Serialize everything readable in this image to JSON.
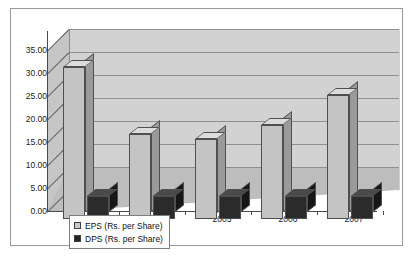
{
  "chart_data": {
    "type": "bar",
    "title": "",
    "xlabel": "",
    "ylabel": "",
    "categories": [
      "2003",
      "2004",
      "2005",
      "2006",
      "2007"
    ],
    "series": [
      {
        "name": "EPS (Rs. per Share)",
        "values": [
          33.0,
          18.5,
          17.5,
          20.5,
          27.0
        ],
        "color": "#c4c4c4"
      },
      {
        "name": "DPS (Rs. per Share)",
        "values": [
          5.0,
          5.0,
          5.0,
          5.0,
          5.0
        ],
        "color": "#2b2b2b"
      }
    ],
    "ylim": [
      0,
      35
    ],
    "ytick_step": 5,
    "ytick_labels": [
      "0.00",
      "5.00",
      "10.00",
      "15.00",
      "20.00",
      "25.00",
      "30.00",
      "35.00"
    ],
    "grid": true,
    "legend_position": "bottom-left",
    "style": "3d-column"
  },
  "legend": {
    "items": [
      {
        "label": "EPS (Rs. per Share)",
        "swatch": "light-gray"
      },
      {
        "label": "DPS (Rs. per Share)",
        "swatch": "black"
      }
    ]
  }
}
